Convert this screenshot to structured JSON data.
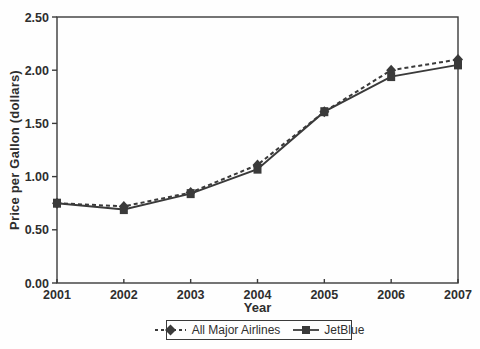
{
  "chart_data": {
    "type": "line",
    "title": "",
    "xlabel": "Year",
    "ylabel": "Price per Gallon (dollars)",
    "categories": [
      "2001",
      "2002",
      "2003",
      "2004",
      "2005",
      "2006",
      "2007"
    ],
    "series": [
      {
        "name": "All Major Airlines",
        "values": [
          0.75,
          0.72,
          0.85,
          1.11,
          1.61,
          2.0,
          2.1
        ],
        "line_style": "dashed",
        "marker": "diamond"
      },
      {
        "name": "JetBlue",
        "values": [
          0.75,
          0.69,
          0.84,
          1.07,
          1.61,
          1.94,
          2.05
        ],
        "line_style": "solid",
        "marker": "square"
      }
    ],
    "ylim": [
      0.0,
      2.5
    ],
    "y_ticks": [
      "0.00",
      "0.50",
      "1.00",
      "1.50",
      "2.00",
      "2.50"
    ],
    "x_ticks": [
      "2001",
      "2002",
      "2003",
      "2004",
      "2005",
      "2006",
      "2007"
    ],
    "grid": false,
    "legend_position": "bottom",
    "line_color": "#3a3a3a",
    "text_color": "#2e2e2e"
  }
}
